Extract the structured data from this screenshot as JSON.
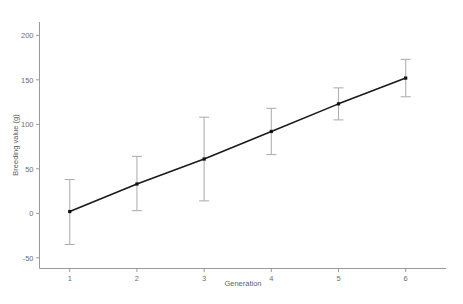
{
  "chart_data": {
    "type": "line",
    "title": "",
    "subtitle": "",
    "xlabel": "Generation",
    "ylabel": "Breeding value (g)",
    "x": [
      1,
      2,
      3,
      4,
      5,
      6
    ],
    "values": [
      2,
      33,
      61,
      92,
      123,
      152
    ],
    "errors_upper": [
      38,
      64,
      108,
      118,
      141,
      173
    ],
    "errors_lower": [
      -35,
      3,
      14,
      66,
      105,
      131
    ],
    "series": [
      {
        "name": "Breeding value",
        "values": [
          2,
          33,
          61,
          92,
          123,
          152
        ],
        "error_upper": [
          38,
          64,
          108,
          118,
          141,
          173
        ],
        "error_lower": [
          -35,
          3,
          14,
          66,
          105,
          131
        ]
      }
    ],
    "xlim": [
      0.55,
      6.6
    ],
    "ylim": [
      -62,
      215
    ],
    "xticks": [
      1,
      2,
      3,
      4,
      5,
      6
    ],
    "xticklabels": [
      "1",
      "2",
      "3",
      "4",
      "5",
      "6"
    ],
    "yticks": [
      -50,
      0,
      50,
      100,
      150,
      200
    ],
    "yticklabels": [
      "-50",
      "0",
      "50",
      "100",
      "150",
      "200"
    ],
    "grid": false,
    "legend": false,
    "legend_position": "none",
    "marker": "square",
    "errorbar_caps": true,
    "colors": {
      "line": "#1a1a1a",
      "marker": "#111111",
      "errorbar": "#b0b0b0",
      "axis": "#9a9a9a",
      "tick_label": "#6e6e6e",
      "axis_title": "#5f5f5f",
      "background": "#ffffff"
    }
  },
  "axes": {
    "y_title": "Breeding value (g)",
    "x_title": "Generation",
    "y_tick_labels": [
      "200",
      "150",
      "100",
      "50",
      "0",
      "-50"
    ],
    "x_tick_labels": [
      "1",
      "2",
      "3",
      "4",
      "5",
      "6"
    ]
  }
}
